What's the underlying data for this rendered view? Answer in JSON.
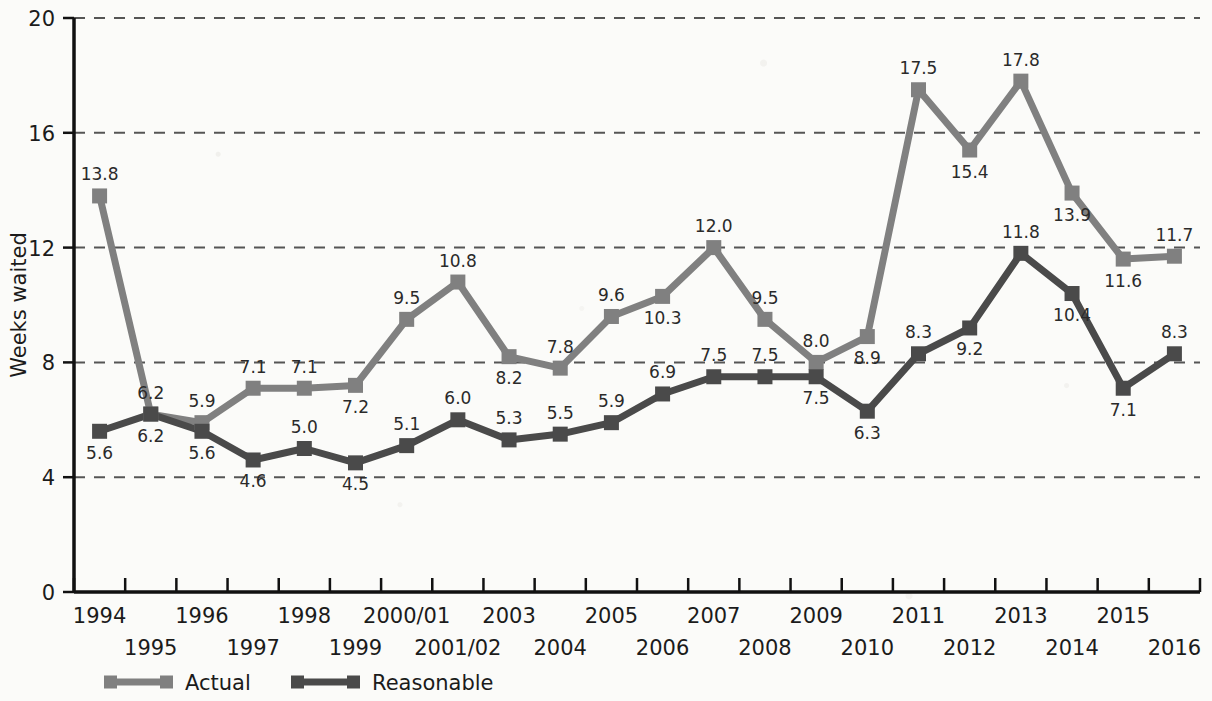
{
  "chart_data": {
    "type": "line",
    "title": "",
    "xlabel": "",
    "ylabel": "Weeks waited",
    "ylim": [
      0,
      20
    ],
    "yticks": [
      0,
      4,
      8,
      12,
      16,
      20
    ],
    "grid": "horizontal-dashed",
    "legend_position": "bottom-left",
    "categories": [
      "1994",
      "1995",
      "1996",
      "1997",
      "1998",
      "1999",
      "2000/01",
      "2001/02",
      "2003",
      "2004",
      "2005",
      "2006",
      "2007",
      "2008",
      "2009",
      "2010",
      "2011",
      "2012",
      "2013",
      "2014",
      "2015",
      "2016"
    ],
    "series": [
      {
        "name": "Actual",
        "color": "#808080",
        "values": [
          13.8,
          6.2,
          5.9,
          7.1,
          7.1,
          7.2,
          9.5,
          10.8,
          8.2,
          7.8,
          9.6,
          10.3,
          12.0,
          9.5,
          8.0,
          8.9,
          17.5,
          15.4,
          17.8,
          13.9,
          11.6,
          11.7
        ],
        "label_text": [
          "13.8",
          "6.2",
          "5.9",
          "7.1",
          "7.1",
          "7.2",
          "9.5",
          "10.8",
          "8.2",
          "7.8",
          "9.6",
          "10.3",
          "12.0",
          "9.5",
          "8.0",
          "8.9",
          "17.5",
          "15.4",
          "17.8",
          "13.9",
          "11.6",
          "11.7"
        ],
        "label_side": [
          "above",
          "above",
          "above",
          "above",
          "above",
          "below",
          "above",
          "above",
          "below",
          "above",
          "above",
          "below",
          "above",
          "above",
          "above",
          "below",
          "above",
          "below",
          "above",
          "below",
          "below",
          "above"
        ]
      },
      {
        "name": "Reasonable",
        "color": "#4a4a4a",
        "values": [
          5.6,
          6.2,
          5.6,
          4.6,
          5.0,
          4.5,
          5.1,
          6.0,
          5.3,
          5.5,
          5.9,
          6.9,
          7.5,
          7.5,
          7.5,
          6.3,
          8.3,
          9.2,
          11.8,
          10.4,
          7.1,
          8.3
        ],
        "label_text": [
          "5.6",
          "6.2",
          "5.6",
          "4.6",
          "5.0",
          "4.5",
          "5.1",
          "6.0",
          "5.3",
          "5.5",
          "5.9",
          "6.9",
          "7.5",
          "7.5",
          "7.5",
          "6.3",
          "8.3",
          "9.2",
          "11.8",
          "10.4",
          "7.1",
          "8.3"
        ],
        "label_side": [
          "below",
          "below",
          "below",
          "below",
          "above",
          "below",
          "above",
          "above",
          "above",
          "above",
          "above",
          "above",
          "above",
          "above",
          "below",
          "below",
          "above",
          "below",
          "above",
          "below",
          "below",
          "above"
        ]
      }
    ]
  },
  "axis": {
    "y_title": "Weeks waited",
    "y_tick_labels": [
      "20",
      "16",
      "12",
      "8",
      "4",
      "0"
    ]
  },
  "legend": {
    "items": [
      {
        "label": "Actual",
        "color": "#808080"
      },
      {
        "label": "Reasonable",
        "color": "#4a4a4a"
      }
    ]
  }
}
